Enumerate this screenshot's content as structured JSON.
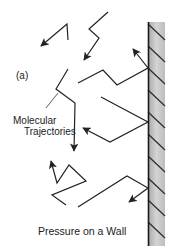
{
  "figure": {
    "panel_label": "(a)",
    "annotation": {
      "line1": "Molecular",
      "line2": "Trajectories"
    },
    "caption": "Pressure on a Wall",
    "wall": {
      "fill_light": "#d8d8d8",
      "fill_dark": "#a9a9a9",
      "edge_color": "#1a1a1a"
    },
    "trajectory_count": 7,
    "line_color": "#222222"
  }
}
